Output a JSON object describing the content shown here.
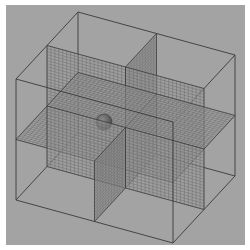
{
  "figure": {
    "elements": [
      {
        "name": "outer-cube",
        "kind": "wireframe box"
      },
      {
        "name": "horizontal-midplane",
        "kind": "meshed plane",
        "orientation": "horizontal"
      },
      {
        "name": "frontal-midplane",
        "kind": "meshed plane",
        "orientation": "vertical, parallel to front face"
      },
      {
        "name": "sagittal-midplane",
        "kind": "meshed plane",
        "orientation": "vertical, parallel to side face"
      },
      {
        "name": "sphere",
        "kind": "solid sphere"
      }
    ],
    "colors": {
      "background": "#a3a3a3",
      "plane_fill": "#9a9a9a",
      "mesh_line": "#5a5a5a",
      "edge_line": "#3a3a3a",
      "sphere": "#4a4a4a"
    },
    "mesh_divisions": 40
  }
}
